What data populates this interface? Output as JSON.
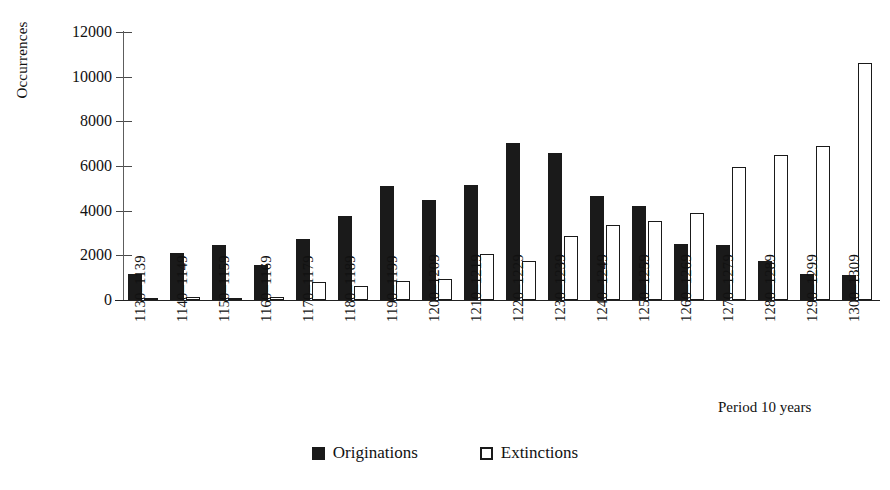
{
  "chart_data": {
    "type": "bar",
    "title": "",
    "xlabel": "Period 10 years",
    "ylabel": "Occurrences",
    "ylim": [
      0,
      12000
    ],
    "ytick_values": [
      0,
      2000,
      4000,
      6000,
      8000,
      10000,
      12000
    ],
    "ytick_labels": [
      "0",
      "2000",
      "4000",
      "6000",
      "8000",
      "10000",
      "12000"
    ],
    "grid": false,
    "legend_position": "bottom-center",
    "categories": [
      "1130–1139",
      "1140–1149",
      "1150–1159",
      "1160–1169",
      "1170–1179",
      "1180–1189",
      "1190–1199",
      "1200–1209",
      "1210–1219",
      "1220–1229",
      "1230–1239",
      "1240–1249",
      "1250–1259",
      "1260–1269",
      "1270–1279",
      "1280–1289",
      "1290–1299",
      "1300–1309"
    ],
    "series": [
      {
        "name": "Originations",
        "color": "#1a1a1a",
        "values": [
          1150,
          2100,
          2450,
          1550,
          2750,
          3750,
          5100,
          4500,
          5150,
          7050,
          6600,
          4650,
          4200,
          2500,
          2450,
          1750,
          1150,
          1100
        ]
      },
      {
        "name": "Extinctions",
        "color": "#ffffff",
        "values": [
          60,
          120,
          70,
          130,
          820,
          620,
          830,
          950,
          2050,
          1750,
          2850,
          3350,
          3550,
          3900,
          5950,
          6500,
          6900,
          10600
        ]
      }
    ]
  },
  "legend": {
    "items": [
      {
        "label": "Originations",
        "swatch": "filled-square-icon"
      },
      {
        "label": "Extinctions",
        "swatch": "hollow-square-icon"
      }
    ]
  }
}
